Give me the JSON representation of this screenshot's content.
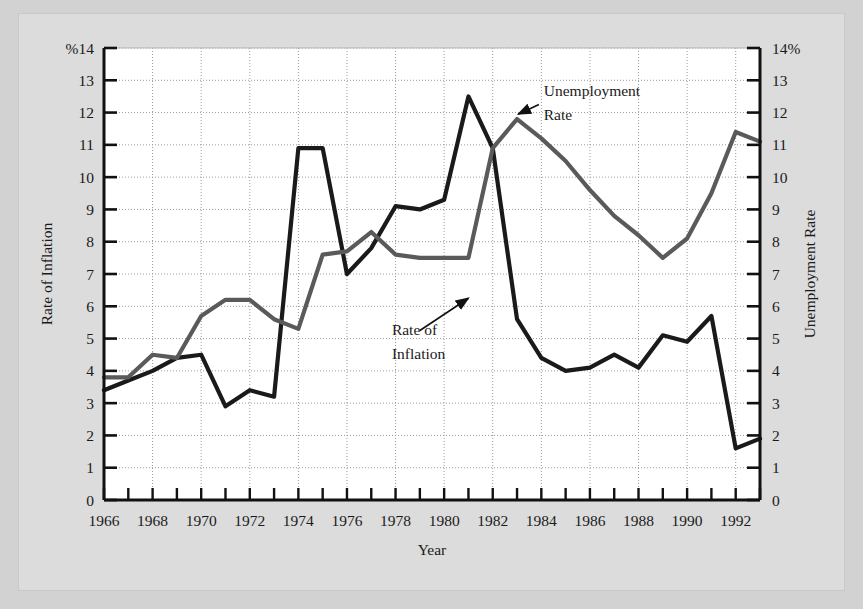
{
  "figure": {
    "background_color": "#dcdcdc",
    "plot_background_color": "#ffffff",
    "page_background_color": "#d2d2d2"
  },
  "chart_data": {
    "type": "line",
    "title": "",
    "xlabel": "Year",
    "ylabel_left": "Rate of Inflation",
    "ylabel_right": "Unemployment Rate",
    "ylim": [
      0,
      14
    ],
    "xlim": [
      1966,
      1993
    ],
    "grid": true,
    "legend_position": "inline-annotations",
    "left_axis_unit_prefix": "%",
    "right_axis_unit_suffix": "%",
    "y_ticks": [
      0,
      1,
      2,
      3,
      4,
      5,
      6,
      7,
      8,
      9,
      10,
      11,
      12,
      13,
      14
    ],
    "y_tick_labels_left": [
      "0",
      "1",
      "2",
      "3",
      "4",
      "5",
      "6",
      "7",
      "8",
      "9",
      "10",
      "11",
      "12",
      "13",
      "%14"
    ],
    "y_tick_labels_right": [
      "0",
      "1",
      "2",
      "3",
      "4",
      "5",
      "6",
      "7",
      "8",
      "9",
      "10",
      "11",
      "12",
      "13",
      "14%"
    ],
    "x_ticks": [
      1966,
      1967,
      1968,
      1969,
      1970,
      1971,
      1972,
      1973,
      1974,
      1975,
      1976,
      1977,
      1978,
      1979,
      1980,
      1981,
      1982,
      1983,
      1984,
      1985,
      1986,
      1987,
      1988,
      1989,
      1990,
      1991,
      1992,
      1993
    ],
    "x_tick_labels": [
      "1966",
      "1968",
      "1970",
      "1972",
      "1974",
      "1976",
      "1978",
      "1980",
      "1982",
      "1984",
      "1986",
      "1988",
      "1990",
      "1992"
    ],
    "x_labeled_ticks": [
      1966,
      1968,
      1970,
      1972,
      1974,
      1976,
      1978,
      1980,
      1982,
      1984,
      1986,
      1988,
      1990,
      1992
    ],
    "x": [
      1966,
      1967,
      1968,
      1969,
      1970,
      1971,
      1972,
      1973,
      1974,
      1975,
      1976,
      1977,
      1978,
      1979,
      1980,
      1981,
      1982,
      1983,
      1984,
      1985,
      1986,
      1987,
      1988,
      1989,
      1990,
      1991,
      1992,
      1993
    ],
    "series": [
      {
        "name": "Rate of Inflation",
        "color": "#1a1a1a",
        "width": 4.2,
        "values": [
          3.4,
          3.7,
          4.0,
          4.4,
          4.5,
          2.9,
          3.4,
          3.2,
          10.9,
          10.9,
          7.0,
          7.8,
          9.1,
          9.0,
          9.3,
          12.5,
          10.9,
          5.6,
          4.4,
          4.0,
          4.1,
          4.5,
          4.1,
          5.1,
          4.9,
          5.7,
          1.6,
          1.9
        ]
      },
      {
        "name": "Unemployment Rate",
        "color": "#5a5a5a",
        "width": 4.2,
        "values": [
          3.8,
          3.8,
          4.5,
          4.4,
          5.7,
          6.2,
          6.2,
          5.6,
          5.3,
          7.6,
          7.7,
          8.3,
          7.6,
          7.5,
          7.5,
          7.5,
          10.9,
          11.8,
          11.2,
          10.5,
          9.6,
          8.8,
          8.2,
          7.5,
          8.1,
          9.5,
          11.4,
          11.1
        ]
      }
    ],
    "annotations": [
      {
        "id": "unemployment-rate-annotation",
        "text_line1": "Unemployment",
        "text_line2": "Rate",
        "text_x": 1984.1,
        "text_y": 12.5,
        "arrow_from_x": 1983.9,
        "arrow_from_y": 12.25,
        "arrow_to_x": 1983.05,
        "arrow_to_y": 11.95
      },
      {
        "id": "rate-of-inflation-annotation",
        "text_line1": "Rate of",
        "text_line2": "Inflation",
        "text_x": 1977.85,
        "text_y": 5.1,
        "arrow_from_x": 1979.0,
        "arrow_from_y": 5.25,
        "arrow_to_x": 1981.0,
        "arrow_to_y": 6.25
      }
    ]
  }
}
